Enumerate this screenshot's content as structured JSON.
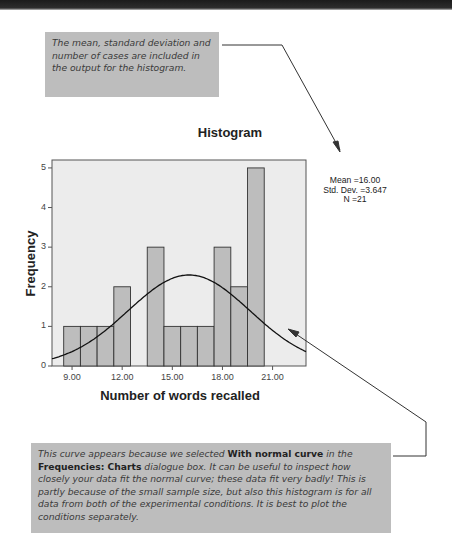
{
  "notes": {
    "top": "The mean, standard deviation and number of cases are included in the output for the histogram.",
    "bottom": {
      "part1": "This curve appears because we selected ",
      "bold1": "With normal curve",
      "part2": " in the ",
      "bold2": "Frequencies: Charts",
      "part3": " dialogue box. It can be useful to inspect how closely your data fit the normal curve; these data fit very badly! This is partly because of the small sample size, but also this histogram is for all data from both of the experimental conditions. It is best to plot the conditions separately."
    }
  },
  "stats": {
    "mean": "Mean =16.00",
    "sd": "Std. Dev. =3.647",
    "n": "N =21"
  },
  "chart_data": {
    "type": "bar",
    "title": "Histogram",
    "xlabel": "Number of words recalled",
    "ylabel": "Frequency",
    "categories": [
      9,
      10,
      11,
      12,
      13,
      14,
      15,
      16,
      17,
      18,
      19,
      20
    ],
    "values": [
      1,
      1,
      1,
      2,
      0,
      3,
      1,
      1,
      1,
      3,
      2,
      5
    ],
    "x_ticks": [
      "9.00",
      "12.00",
      "15.00",
      "18.00",
      "21.00"
    ],
    "y_ticks": [
      "0",
      "1",
      "2",
      "3",
      "4",
      "5"
    ],
    "ylim": [
      0,
      5.2
    ],
    "xlim": [
      7.8,
      23.0
    ],
    "normal_curve": {
      "mean": 16.0,
      "sd": 3.647,
      "n": 21
    },
    "colors": {
      "plot_bg": "#ececec",
      "bar": "#bdbdbd",
      "bar_edge": "#333333",
      "curve": "#111111"
    },
    "grid": false,
    "legend": "none"
  }
}
